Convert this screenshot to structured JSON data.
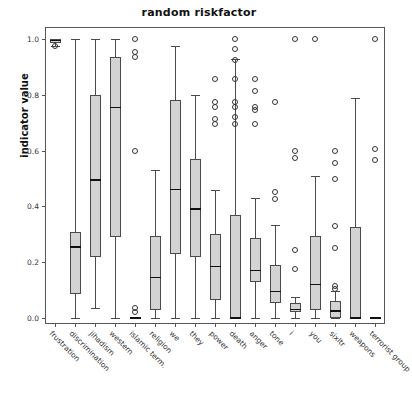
{
  "chart_data": {
    "type": "box",
    "title": "random riskfactor",
    "xlabel": "",
    "ylabel": "indicator value",
    "ylim": [
      -0.035,
      1.05
    ],
    "yticks": [
      0.0,
      0.2,
      0.4,
      0.6,
      0.8,
      1.0
    ],
    "ytick_labels": [
      "0.0",
      "0.2",
      "0.4",
      "0.6",
      "0.8",
      "1.0"
    ],
    "grid": false,
    "legend": "none",
    "categories": [
      "frustration",
      "discrimination",
      "jihadism",
      "western",
      "islamic term.",
      "religion",
      "we",
      "they",
      "power",
      "death",
      "anger",
      "tone",
      "i",
      "you",
      "sixltr",
      "weapons",
      "terrorist group"
    ],
    "boxes": [
      {
        "label": "frustration",
        "whislo": 0.975,
        "q1": 0.985,
        "med": 0.995,
        "q3": 1.0,
        "whishi": 1.0,
        "fliers": [
          0.975
        ]
      },
      {
        "label": "discrimination",
        "whislo": 0.0,
        "q1": 0.085,
        "med": 0.255,
        "q3": 0.31,
        "whishi": 1.0,
        "fliers": []
      },
      {
        "label": "jihadism",
        "whislo": 0.035,
        "q1": 0.22,
        "med": 0.495,
        "q3": 0.8,
        "whishi": 1.0,
        "fliers": []
      },
      {
        "label": "western",
        "whislo": 0.0,
        "q1": 0.29,
        "med": 0.755,
        "q3": 0.935,
        "whishi": 1.0,
        "fliers": []
      },
      {
        "label": "islamic term.",
        "whislo": 0.0,
        "q1": 0.0,
        "med": 0.0,
        "q3": 0.0,
        "whishi": 0.0,
        "fliers": [
          1.0,
          0.955,
          0.935,
          0.6,
          0.035,
          0.02
        ]
      },
      {
        "label": "religion",
        "whislo": 0.0,
        "q1": 0.03,
        "med": 0.145,
        "q3": 0.295,
        "whishi": 0.53,
        "fliers": []
      },
      {
        "label": "we",
        "whislo": 0.0,
        "q1": 0.23,
        "med": 0.46,
        "q3": 0.78,
        "whishi": 0.975,
        "fliers": []
      },
      {
        "label": "they",
        "whislo": 0.0,
        "q1": 0.22,
        "med": 0.39,
        "q3": 0.57,
        "whishi": 0.8,
        "fliers": []
      },
      {
        "label": "power",
        "whislo": 0.0,
        "q1": 0.065,
        "med": 0.185,
        "q3": 0.3,
        "whishi": 0.46,
        "fliers": [
          0.855,
          0.775,
          0.755,
          0.715,
          0.695
        ]
      },
      {
        "label": "death",
        "whislo": 0.0,
        "q1": 0.0,
        "med": 0.0,
        "q3": 0.37,
        "whishi": 0.93,
        "fliers": [
          1.0,
          0.965,
          0.925,
          0.855,
          0.775,
          0.755,
          0.72,
          0.695
        ]
      },
      {
        "label": "anger",
        "whislo": 0.0,
        "q1": 0.13,
        "med": 0.17,
        "q3": 0.285,
        "whishi": 0.43,
        "fliers": [
          0.855,
          0.815,
          0.755,
          0.745,
          0.695
        ]
      },
      {
        "label": "tone",
        "whislo": 0.0,
        "q1": 0.055,
        "med": 0.095,
        "q3": 0.19,
        "whishi": 0.335,
        "fliers": [
          0.775,
          0.45,
          0.425
        ]
      },
      {
        "label": "i",
        "whislo": 0.0,
        "q1": 0.02,
        "med": 0.03,
        "q3": 0.055,
        "whishi": 0.075,
        "fliers": [
          1.0,
          0.6,
          0.575,
          0.245,
          0.175
        ]
      },
      {
        "label": "you",
        "whislo": 0.0,
        "q1": 0.03,
        "med": 0.12,
        "q3": 0.295,
        "whishi": 0.51,
        "fliers": [
          1.0
        ]
      },
      {
        "label": "sixltr",
        "whislo": 0.0,
        "q1": 0.0,
        "med": 0.025,
        "q3": 0.06,
        "whishi": 0.095,
        "fliers": [
          0.6,
          0.555,
          0.5,
          0.33,
          0.25,
          0.115,
          0.105
        ]
      },
      {
        "label": "weapons",
        "whislo": 0.0,
        "q1": 0.0,
        "med": 0.0,
        "q3": 0.325,
        "whishi": 0.79,
        "fliers": []
      },
      {
        "label": "terrorist group",
        "whislo": 0.0,
        "q1": 0.0,
        "med": 0.0,
        "q3": 0.0,
        "whishi": 0.0,
        "fliers": [
          1.0,
          0.605,
          0.565
        ]
      }
    ]
  },
  "style": {
    "box_fill": "#d3d3d3",
    "box_edge": "#4a4a4a",
    "median_color": "#111111",
    "background": "#ffffff"
  }
}
